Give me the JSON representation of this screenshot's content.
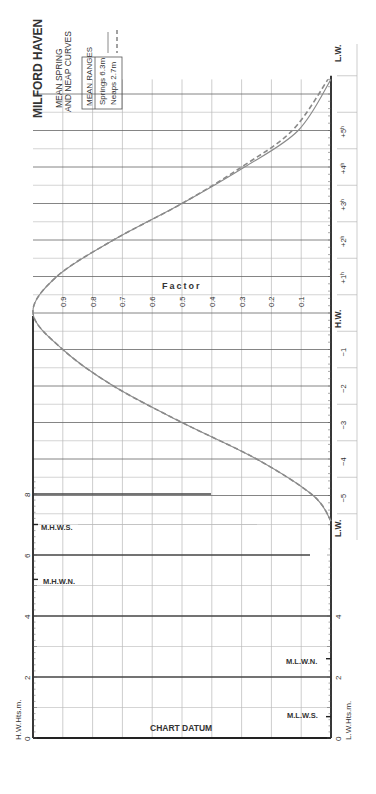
{
  "title": "MILFORD HAVEN",
  "subtitle_line1": "MEAN SPRING",
  "subtitle_line2": "AND NEAP CURVES",
  "legend": {
    "header": "MEAN RANGES",
    "springs": "Springs  6.3m",
    "neaps": "Neaps  2.7m"
  },
  "factor_label": "Factor",
  "chart_datum_label": "CHART DATUM",
  "hw_axis_label": "H.W.Hts.m.",
  "lw_axis_label": "L.W.Hts.m.",
  "hw_label": "H.W.",
  "lw_label_top": "L.W.",
  "lw_label_bottom": "L.W.",
  "levels": {
    "mhws": "M.H.W.S.",
    "mhwn": "M.H.W.N.",
    "mlwn": "M.L.W.N.",
    "mlws": "M.L.W.S."
  },
  "colors": {
    "curve": "#8a8a8a",
    "grid": "#b8b8b8",
    "axis": "#222222",
    "text": "#333333"
  },
  "chart_data": {
    "type": "line",
    "xlabel": "Time from H.W. (hours)",
    "ylabel": "Factor",
    "x_ticks": [
      "L.W.",
      "-5",
      "-4",
      "-3",
      "-2",
      "-1",
      "H.W.",
      "+1h",
      "+2h",
      "+3h",
      "+4h",
      "+5h",
      "L.W."
    ],
    "factor_ticks": [
      "0.1",
      "0.2",
      "0.3",
      "0.4",
      "0.5",
      "0.6",
      "0.7",
      "0.8",
      "0.9"
    ],
    "ylim": [
      0,
      1
    ],
    "series": [
      {
        "name": "Springs 6.3m",
        "style": "solid",
        "x": [
          -5.7,
          -5,
          -4,
          -3,
          -2,
          -1,
          0,
          1,
          2,
          3,
          4,
          5,
          6.4
        ],
        "values": [
          0.0,
          0.06,
          0.25,
          0.5,
          0.73,
          0.9,
          1.0,
          0.92,
          0.73,
          0.5,
          0.29,
          0.11,
          0.0
        ]
      },
      {
        "name": "Neaps 2.7m",
        "style": "dashed",
        "x": [
          -5.7,
          -5,
          -4,
          -3,
          -2,
          -1,
          0,
          1,
          2,
          3,
          4,
          5,
          6.4
        ],
        "values": [
          0.0,
          0.06,
          0.25,
          0.5,
          0.73,
          0.9,
          1.0,
          0.92,
          0.73,
          0.5,
          0.3,
          0.13,
          0.01
        ]
      }
    ],
    "hw_heights_axis": {
      "label": "H.W.Hts.m.",
      "ticks": [
        0,
        2,
        4,
        6,
        8
      ],
      "range": [
        0,
        8.5
      ]
    },
    "lw_heights_axis": {
      "label": "L.W.Hts.m.",
      "ticks": [
        0,
        2,
        4
      ],
      "range": [
        0,
        4.5
      ]
    },
    "reference_levels": [
      {
        "name": "M.H.W.S.",
        "height_m": 7.0
      },
      {
        "name": "M.H.W.N.",
        "height_m": 5.2
      },
      {
        "name": "M.L.W.N.",
        "height_m": 2.6
      },
      {
        "name": "M.L.W.S.",
        "height_m": 0.7
      }
    ],
    "grid": true
  }
}
